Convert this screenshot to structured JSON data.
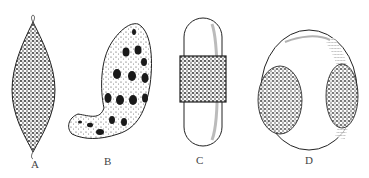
{
  "figure": {
    "panels": [
      {
        "id": "A",
        "label": "A",
        "description": "spindle-shaped, densely textured body with small hooked tips at both ends"
      },
      {
        "id": "B",
        "label": "B",
        "description": "curved, bean-like body with rows of dark oval spots"
      },
      {
        "id": "C",
        "label": "C",
        "description": "capsule-shaped body with smooth ends and a textured central band"
      },
      {
        "id": "D",
        "label": "D",
        "description": "rounded oval body with two textured lateral caps"
      }
    ],
    "colors": {
      "ink": "#222222",
      "background": "#ffffff"
    }
  }
}
